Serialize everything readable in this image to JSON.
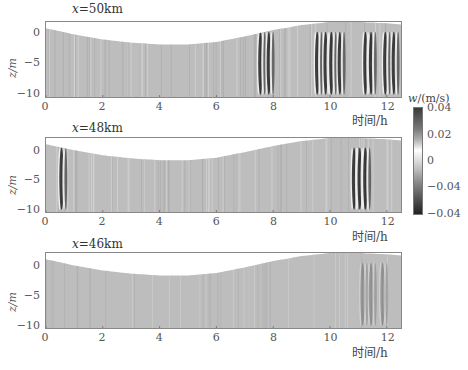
{
  "chart_data": {
    "type": "heatmap",
    "xlabel": "时间/h",
    "ylabel": "z/m",
    "xlim": [
      0,
      12.5
    ],
    "ylim": [
      -10,
      2
    ],
    "x_ticks": [
      "0",
      "2",
      "4",
      "6",
      "8",
      "10",
      "12"
    ],
    "y_ticks": [
      "0",
      "−5",
      "−10"
    ],
    "colorbar": {
      "label": "w/(m/s)",
      "tick_labels": [
        "0.04",
        "0.02",
        "0",
        "−0.04",
        "−0.04"
      ],
      "colormap": "gray diverging (dark = extreme, white = 0)"
    },
    "surface_elevation_profile": {
      "description": "free surface (white above) varies with tide",
      "t": [
        0,
        1,
        2,
        3,
        4,
        5,
        6,
        7,
        8,
        9,
        10,
        11,
        12,
        12.5
      ],
      "z": [
        1.0,
        0.0,
        -0.8,
        -1.3,
        -1.6,
        -1.6,
        -1.2,
        -0.3,
        0.7,
        1.5,
        2.0,
        2.0,
        1.8,
        1.6
      ]
    },
    "panels": [
      {
        "title": "x=50km",
        "strong_signals_hours": [
          7.6,
          7.9,
          9.6,
          9.9,
          10.1,
          10.4,
          11.3,
          11.5,
          12.0,
          12.3
        ],
        "note": "strong alternating vertical velocity bands 7.3–8.3 h and 9.4–12.4 h"
      },
      {
        "title": "x=48km",
        "strong_signals_hours": [
          0.6,
          10.9,
          11.1,
          11.3
        ],
        "note": "strong packet centered near 11.1 h, weak isolated band at 0.6 h"
      },
      {
        "title": "x=46km",
        "strong_signals_hours": [
          11.2,
          11.5,
          11.9
        ],
        "note": "weak signals only, faint bands 11–12.5 h"
      }
    ]
  },
  "panels": [
    {
      "title_var": "x",
      "title_val": "=50km"
    },
    {
      "title_var": "x",
      "title_val": "=48km"
    },
    {
      "title_var": "x",
      "title_val": "=46km"
    }
  ],
  "axes": {
    "xlabel": "时间/h",
    "ylabel": "z/m",
    "x_ticks": [
      "0",
      "2",
      "4",
      "6",
      "8",
      "10",
      "12"
    ],
    "y_ticks": [
      "0",
      "−5",
      "−10"
    ]
  },
  "colorbar": {
    "label_var": "w",
    "label_unit": "/(m/s)",
    "ticks": [
      "0.04",
      "0.02",
      "0",
      "−0.04",
      "−0.04"
    ]
  }
}
